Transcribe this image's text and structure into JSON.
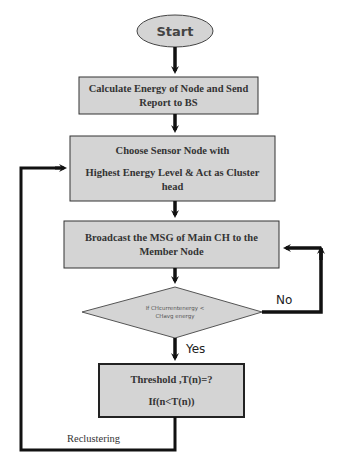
{
  "flowchart": {
    "start": {
      "label": "Start"
    },
    "steps": [
      {
        "id": "calc",
        "label_lines": [
          "Calculate Energy of Node and Send",
          "Report to BS"
        ]
      },
      {
        "id": "choose",
        "label_lines": [
          "Choose Sensor Node with",
          "Highest Energy Level & Act as Cluster",
          "head"
        ]
      },
      {
        "id": "broadcast",
        "label_lines": [
          "Broadcast the MSG of Main CH to the",
          "Member Node"
        ]
      }
    ],
    "decision": {
      "label_lines": [
        "If CHcurrentenergy <",
        "CHavg energy"
      ]
    },
    "threshold": {
      "label_lines": [
        "Threshold ,T(n)=?",
        "If(n<T(n))"
      ]
    },
    "edges": {
      "yes_label": "Yes",
      "no_label": "No",
      "recluster_label": "Reclustering"
    }
  },
  "colors": {
    "box_fill": "#d4d4d4",
    "box_stroke": "#222222",
    "arrow": "#111111",
    "background": "#ffffff"
  }
}
